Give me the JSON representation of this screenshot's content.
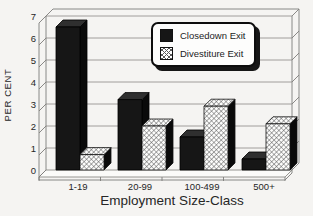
{
  "chart_data": {
    "type": "bar",
    "effect": "3d",
    "title": "",
    "categories": [
      "1-19",
      "20-99",
      "100-499",
      "500+"
    ],
    "series": [
      {
        "name": "Closedown Exit",
        "style": "solid-black",
        "values": [
          6.5,
          3.2,
          1.5,
          0.5
        ]
      },
      {
        "name": "Divestiture Exit",
        "style": "crosshatch",
        "values": [
          0.7,
          2.0,
          2.9,
          2.1
        ]
      }
    ],
    "xlabel": "Employment Size-Class",
    "ylabel": "PER CENT",
    "ylim": [
      0,
      7
    ],
    "yticks": [
      0,
      1,
      2,
      3,
      4,
      5,
      6,
      7
    ],
    "grid": true,
    "legend_position": "top-right",
    "colors": {
      "bar_solid": "#161616",
      "bar_pattern_line": "#565656",
      "bar_side": "#0a0a0a",
      "frame_line": "#7e7d7a",
      "background": "#f5f4f2",
      "text": "#262626"
    }
  }
}
